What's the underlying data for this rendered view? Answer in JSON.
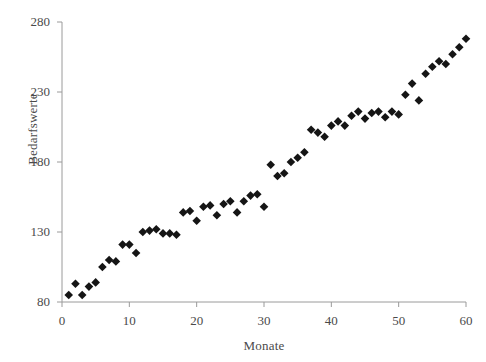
{
  "chart_data": {
    "type": "scatter",
    "title": "",
    "xlabel": "Monate",
    "ylabel": "Bedarfswerte",
    "xlim": [
      0,
      60
    ],
    "ylim": [
      80,
      280
    ],
    "xticks": [
      0,
      10,
      20,
      30,
      40,
      50,
      60
    ],
    "yticks": [
      80,
      130,
      180,
      230,
      280
    ],
    "grid": false,
    "legend": null,
    "marker": "filled-diamond",
    "marker_color": "#151515",
    "axis_color": "#9a9a9a",
    "background": "#ffffff",
    "x": [
      1,
      2,
      3,
      4,
      5,
      6,
      7,
      8,
      9,
      10,
      11,
      12,
      13,
      14,
      15,
      16,
      17,
      18,
      19,
      20,
      21,
      22,
      23,
      24,
      25,
      26,
      27,
      28,
      29,
      30,
      31,
      32,
      33,
      34,
      35,
      36,
      37,
      38,
      39,
      40,
      41,
      42,
      43,
      44,
      45,
      46,
      47,
      48,
      49,
      50,
      51,
      52,
      53,
      54,
      55,
      56,
      57,
      58,
      59,
      60
    ],
    "y": [
      85,
      93,
      85,
      91,
      94,
      105,
      110,
      109,
      121,
      121,
      115,
      130,
      131,
      132,
      129,
      129,
      128,
      144,
      145,
      138,
      148,
      149,
      142,
      150,
      152,
      144,
      152,
      156,
      157,
      148,
      178,
      170,
      172,
      180,
      183,
      187,
      203,
      201,
      198,
      206,
      209,
      206,
      213,
      216,
      211,
      215,
      216,
      212,
      216,
      214,
      228,
      236,
      224,
      243,
      248,
      252,
      250,
      257,
      262,
      268
    ]
  },
  "axis": {
    "y_tick_labels": [
      "280",
      "230",
      "180",
      "130",
      "80"
    ],
    "x_tick_labels": [
      "0",
      "10",
      "20",
      "30",
      "40",
      "50",
      "60"
    ],
    "x_axis_title": "Monate",
    "y_axis_title": "Bedarfswerte"
  }
}
